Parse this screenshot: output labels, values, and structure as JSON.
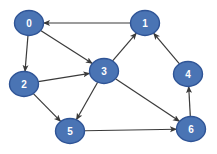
{
  "diagram": {
    "type": "directed-graph",
    "background": "#ffffff",
    "canvas": {
      "width": 217,
      "height": 154
    },
    "node_style": {
      "fill": "#4a74b4",
      "stroke": "#2f5496",
      "stroke_width": 1.4,
      "rx": 14.5,
      "ry": 12.5,
      "label_color": "#ffffff",
      "label_size": 10
    },
    "edge_style": {
      "color": "#3a3a3a",
      "width": 1.2
    },
    "nodes": [
      {
        "id": "0",
        "label": "0",
        "x": 29,
        "y": 23
      },
      {
        "id": "1",
        "label": "1",
        "x": 145,
        "y": 23
      },
      {
        "id": "2",
        "label": "2",
        "x": 24,
        "y": 84
      },
      {
        "id": "3",
        "label": "3",
        "x": 104,
        "y": 71
      },
      {
        "id": "4",
        "label": "4",
        "x": 188,
        "y": 74
      },
      {
        "id": "5",
        "label": "5",
        "x": 70,
        "y": 131
      },
      {
        "id": "6",
        "label": "6",
        "x": 191,
        "y": 129
      }
    ],
    "edges": [
      {
        "from": "1",
        "to": "0"
      },
      {
        "from": "0",
        "to": "2"
      },
      {
        "from": "0",
        "to": "3"
      },
      {
        "from": "2",
        "to": "3"
      },
      {
        "from": "2",
        "to": "5"
      },
      {
        "from": "3",
        "to": "1"
      },
      {
        "from": "3",
        "to": "5"
      },
      {
        "from": "3",
        "to": "6"
      },
      {
        "from": "4",
        "to": "1"
      },
      {
        "from": "5",
        "to": "6"
      },
      {
        "from": "6",
        "to": "4"
      }
    ]
  }
}
